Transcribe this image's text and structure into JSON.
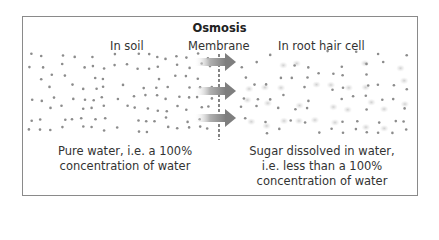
{
  "diagram": {
    "title": "Osmosis",
    "labels": {
      "left_region": "In soil",
      "membrane": "Membrane",
      "right_region": "In root hair cell"
    },
    "captions": {
      "left_line1": "Pure water, i.e. a 100%",
      "left_line2": "concentration of water",
      "right_line1": "Sugar dissolved in water,",
      "right_line2": "i.e. less than a 100%",
      "right_line3": "concentration of water"
    },
    "elements": {
      "water_molecule": "small grey dot",
      "sugar_molecule": "larger pale grey blurred dot",
      "membrane": "vertical dashed line",
      "arrows": "3 grey gradient arrows pointing right (water moving into cell)"
    },
    "colors": {
      "frame": "#8a8a8a",
      "water_dot": "#8c8c8c",
      "sugar_dot": "#d6d6d6",
      "arrow": "#8e8e8e",
      "text": "#333333"
    }
  }
}
